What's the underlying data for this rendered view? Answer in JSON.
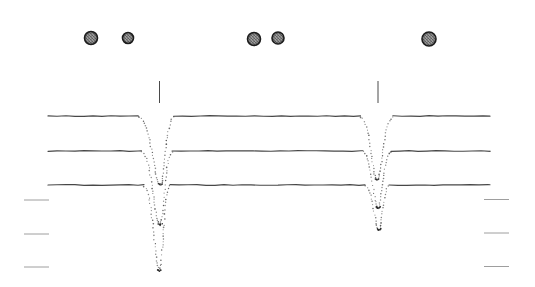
{
  "figure": {
    "name": "occultation-lightcurve-figure",
    "width": 535,
    "height": 287,
    "background": "#ffffff",
    "has_text": false
  },
  "chart_data": {
    "type": "line",
    "title": "",
    "xlabel": "",
    "ylabel": "",
    "coordinate_space": "pixel coordinates; figure contains no axis tick labels or text",
    "style": {
      "curve_color": "#474747",
      "dot_color_range": [
        90,
        155
      ],
      "vertex_color": "#2b2b2b",
      "tick_color": "#4a4a4a",
      "dash_color": "#9e9e9e",
      "disk_ring_color": "#1c1c1c"
    },
    "disk_symbols": [
      {
        "cx": 91,
        "cy": 38,
        "r": 6.5
      },
      {
        "cx": 128,
        "cy": 38,
        "r": 5.5
      },
      {
        "cx": 254,
        "cy": 39,
        "r": 6.5
      },
      {
        "cx": 278,
        "cy": 38,
        "r": 6.0
      },
      {
        "cx": 429,
        "cy": 39,
        "r": 7.0
      }
    ],
    "event_ticks": [
      {
        "x": 159.5,
        "y1": 81,
        "y2": 103
      },
      {
        "x": 378.0,
        "y1": 81,
        "y2": 103
      }
    ],
    "curves": [
      {
        "baseline_y": 116,
        "x_start": 48,
        "x_end": 490,
        "dips": [
          {
            "gap_x1": 138.5,
            "gap_x2": 173.5,
            "vertex_x": 160.5,
            "depth": 69
          },
          {
            "gap_x1": 360.5,
            "gap_x2": 393.0,
            "vertex_x": 377.0,
            "depth": 64
          }
        ]
      },
      {
        "baseline_y": 151,
        "x_start": 48,
        "x_end": 490,
        "dips": [
          {
            "gap_x1": 141.5,
            "gap_x2": 172.0,
            "vertex_x": 160.0,
            "depth": 74
          },
          {
            "gap_x1": 363.0,
            "gap_x2": 391.0,
            "vertex_x": 378.0,
            "depth": 57
          }
        ]
      },
      {
        "baseline_y": 185,
        "x_start": 48,
        "x_end": 490,
        "dips": [
          {
            "gap_x1": 144.0,
            "gap_x2": 170.0,
            "vertex_x": 159.5,
            "depth": 86
          },
          {
            "gap_x1": 365.0,
            "gap_x2": 389.0,
            "vertex_x": 379.0,
            "depth": 45
          }
        ]
      }
    ],
    "edge_dashes": {
      "left": [
        {
          "x1": 24,
          "x2": 49,
          "y": 200
        },
        {
          "x1": 24,
          "x2": 49,
          "y": 234
        },
        {
          "x1": 24,
          "x2": 49,
          "y": 267
        }
      ],
      "right": [
        {
          "x1": 484,
          "x2": 509,
          "y": 199.5
        },
        {
          "x1": 484,
          "x2": 509,
          "y": 233
        },
        {
          "x1": 484,
          "x2": 509,
          "y": 266.5
        }
      ]
    }
  }
}
